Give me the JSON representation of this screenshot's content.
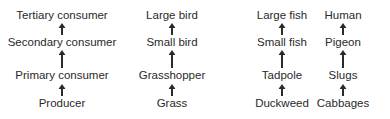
{
  "diagram": {
    "type": "food-chains",
    "chains": [
      {
        "name": "generic",
        "center_x": 62,
        "levels": [
          "Producer",
          "Primary consumer",
          "Secondary consumer",
          "Tertiary consumer"
        ]
      },
      {
        "name": "grassland",
        "center_x": 172,
        "levels": [
          "Grass",
          "Grasshopper",
          "Small bird",
          "Large bird"
        ]
      },
      {
        "name": "pond",
        "center_x": 282,
        "levels": [
          "Duckweed",
          "Tadpole",
          "Small fish",
          "Large fish"
        ]
      },
      {
        "name": "garden",
        "center_x": 343,
        "levels": [
          "Cabbages",
          "Slugs",
          "Pigeon",
          "Human"
        ]
      }
    ],
    "arrow_color": "#2a2a2a",
    "text_color": "#2a2a2a"
  }
}
